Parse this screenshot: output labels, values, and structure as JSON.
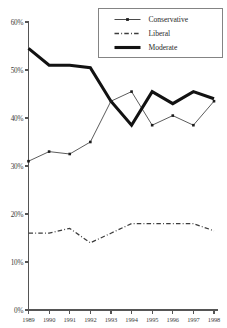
{
  "chart_data": {
    "type": "line",
    "title": "",
    "subtitle": "",
    "xlabel": "",
    "ylabel": "",
    "categories": [
      "1989",
      "1990",
      "1991",
      "1992",
      "1993",
      "1994",
      "1995",
      "1996",
      "1997",
      "1998"
    ],
    "x": [
      1989,
      1990,
      1991,
      1992,
      1993,
      1994,
      1995,
      1996,
      1997,
      1998
    ],
    "ylim": [
      0,
      60
    ],
    "xlim": [
      1989,
      1998
    ],
    "y_ticks": [
      0,
      10,
      20,
      30,
      40,
      50,
      60
    ],
    "y_tick_labels": [
      "0%",
      "10%",
      "20%",
      "30%",
      "40%",
      "50%",
      "60%"
    ],
    "x_tick_labels": [
      "1989",
      "1990",
      "1991",
      "1992",
      "1993",
      "1994",
      "1995",
      "1996",
      "1997",
      "1998"
    ],
    "grid": false,
    "legend_position": "top-right",
    "series": [
      {
        "name": "Conservative",
        "style": "solid-thin-with-square-markers",
        "color": "#4a4a4a",
        "markers": true,
        "values": [
          31.0,
          33.0,
          32.5,
          35.0,
          43.5,
          45.5,
          38.5,
          40.5,
          38.5,
          43.5
        ]
      },
      {
        "name": "Liberal",
        "style": "dash-dot",
        "color": "#3c3c3c",
        "markers": false,
        "values": [
          16.0,
          16.0,
          17.0,
          14.0,
          16.0,
          18.0,
          18.0,
          18.0,
          18.0,
          16.5
        ]
      },
      {
        "name": "Moderate",
        "style": "solid-thick",
        "color": "#121212",
        "markers": false,
        "values": [
          54.5,
          51.0,
          51.0,
          50.5,
          43.5,
          38.5,
          45.5,
          43.0,
          45.5,
          44.0
        ]
      }
    ]
  },
  "legend": {
    "entries": [
      {
        "label": "Conservative"
      },
      {
        "label": "Liberal"
      },
      {
        "label": "Moderate"
      }
    ]
  },
  "axes": {
    "y_axis_name": "percent-axis",
    "x_axis_name": "year-axis"
  }
}
